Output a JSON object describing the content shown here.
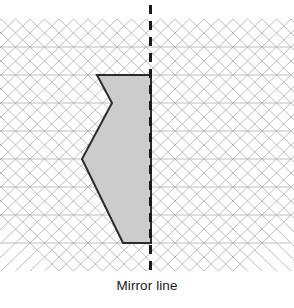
{
  "figure": {
    "caption": "Mirror line",
    "background_color": "#ffffff"
  },
  "grid": {
    "name": "triangular-isometric-grid",
    "line_color": "#b6b6b6",
    "line_width": 0.9,
    "cell_width": 29,
    "cell_height": 28,
    "x_start": 1,
    "x_end": 290,
    "y_top": 19,
    "y_bottom": 271,
    "horizontal_rows": [
      47,
      75,
      103,
      131,
      159,
      187,
      215,
      243
    ],
    "rows": 9,
    "columns": 10
  },
  "mirror_line": {
    "name": "mirror-line",
    "label": "Mirror line",
    "x": 150.5,
    "y_start": 5,
    "y_end": 272,
    "color": "#1a1a1a",
    "width": 3,
    "dash": "9 7"
  },
  "shape": {
    "name": "shaded-arrow-shape",
    "fill_color": "#cccccc",
    "stroke_color": "#2b2b2b",
    "stroke_width": 2,
    "vertices": [
      {
        "x": 97,
        "y": 75,
        "label": "top-left"
      },
      {
        "x": 151,
        "y": 75,
        "label": "top-right"
      },
      {
        "x": 151,
        "y": 243,
        "label": "bottom-right"
      },
      {
        "x": 123,
        "y": 243,
        "label": "bottom-left"
      },
      {
        "x": 82,
        "y": 159,
        "label": "left-point"
      },
      {
        "x": 112,
        "y": 103,
        "label": "notch"
      }
    ],
    "points_attr": "97,75 151,75 151,243 123,243 82,159 112,103"
  }
}
